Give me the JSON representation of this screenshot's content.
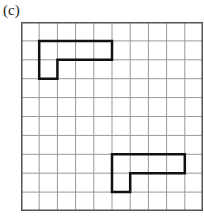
{
  "figure": {
    "label": "(c)",
    "grid": {
      "cols": 10,
      "rows": 10,
      "cell_w": 18.2,
      "cell_h": 18.9
    },
    "shapes": [
      {
        "name": "top-l-shape",
        "cells": [
          [
            1,
            1
          ],
          [
            2,
            1
          ],
          [
            3,
            1
          ],
          [
            4,
            1
          ],
          [
            1,
            2
          ]
        ]
      },
      {
        "name": "bottom-l-shape",
        "cells": [
          [
            5,
            7
          ],
          [
            6,
            7
          ],
          [
            7,
            7
          ],
          [
            8,
            7
          ],
          [
            5,
            8
          ]
        ]
      }
    ],
    "colors": {
      "grid_line": "#999999",
      "border": "#555555",
      "shape": "#111111"
    }
  }
}
